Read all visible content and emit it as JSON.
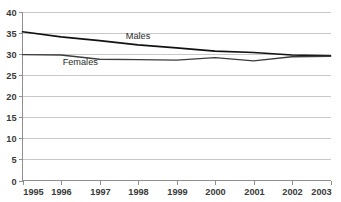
{
  "chart_data": {
    "type": "line",
    "title": "",
    "subtitle": "",
    "xlabel": "",
    "ylabel": "",
    "categories": [
      "1995",
      "1996",
      "1997",
      "1998",
      "1999",
      "2000",
      "2001",
      "2002",
      "2003"
    ],
    "x": [
      1995,
      1996,
      1997,
      1998,
      1999,
      2000,
      2001,
      2002,
      2003
    ],
    "xlim": [
      1995,
      2003
    ],
    "ylim": [
      0,
      40
    ],
    "yticks": [
      0,
      5,
      10,
      15,
      20,
      25,
      30,
      35,
      40
    ],
    "ytick_labels": [
      "0",
      "5",
      "10",
      "15",
      "20",
      "25",
      "30",
      "35",
      "40"
    ],
    "xtick_labels": [
      "1995",
      "1996",
      "1997",
      "1998",
      "1999",
      "2000",
      "2001",
      "2002",
      "2003"
    ],
    "grid": "horizontal",
    "legend": "inline-labels",
    "series": [
      {
        "name": "Males",
        "label": "Males",
        "color": "#111111",
        "label_x": 1998.0,
        "label_y": 33.6,
        "values": [
          35.2,
          34.0,
          33.1,
          32.1,
          31.4,
          30.6,
          30.3,
          29.7,
          29.5
        ]
      },
      {
        "name": "Females",
        "label": "Females",
        "color": "#3c3c3c",
        "label_x": 1996.5,
        "label_y": 27.4,
        "values": [
          29.8,
          29.7,
          28.7,
          28.6,
          28.5,
          29.1,
          28.3,
          29.3,
          29.4
        ]
      }
    ],
    "colors": {
      "background": "#ffffff",
      "gridline": "#c9c9c9",
      "axis": "#8f8f8f",
      "tick_text": "#3a3a3a",
      "series_label_text": "#2b2b2b"
    }
  }
}
